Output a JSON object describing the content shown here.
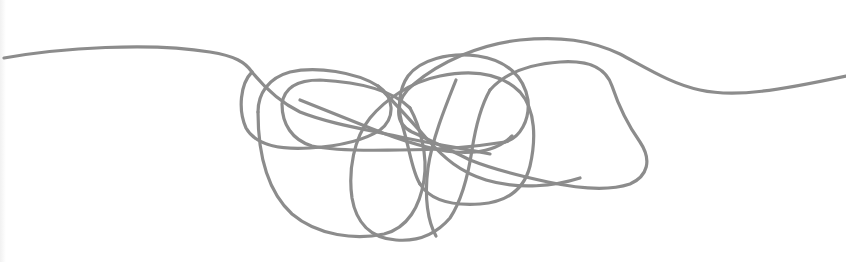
{
  "illustration": {
    "subject": "tangled-line",
    "description": "A single continuous gray line running left to right that knots into a messy tangle of loops in the middle before straightening out again.",
    "colors": {
      "background": "#ffffff",
      "line": "#8c8c8c"
    },
    "stroke_width": 3.2
  }
}
